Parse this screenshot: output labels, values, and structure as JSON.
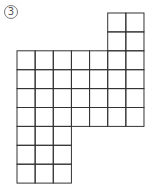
{
  "figure": {
    "label": "3",
    "grid": {
      "origin_x": 17,
      "origin_y": 13,
      "cell_w": 18.14,
      "cell_h": 18.9,
      "cols": 7,
      "rows": 9
    },
    "blocks": [
      {
        "name": "top-right-block",
        "col": 5,
        "row": 0,
        "cols": 2,
        "rows": 2
      },
      {
        "name": "main-block",
        "col": 0,
        "row": 2,
        "cols": 7,
        "rows": 4
      },
      {
        "name": "bottom-left-block",
        "col": 0,
        "row": 6,
        "cols": 3,
        "rows": 3
      }
    ],
    "line_color": "#333333"
  }
}
